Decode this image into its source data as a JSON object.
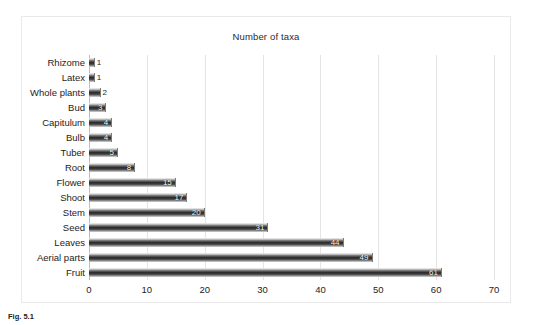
{
  "figure": {
    "caption_label": "Fig. 5.1",
    "caption_text": ""
  },
  "chart": {
    "title": "Number of taxa",
    "frame_border_color": "#e9e9e9",
    "gridline_color": "#e4e4e4",
    "bar_dark_color": "#2e2e2e",
    "bar_light_color": "#f2f2f2",
    "label_color": "#1d1d1d"
  },
  "chart_data": {
    "type": "bar",
    "orientation": "horizontal",
    "title": "Number of taxa",
    "xlabel": "",
    "ylabel": "",
    "xlim": [
      0,
      70
    ],
    "xticks": [
      0,
      10,
      20,
      30,
      40,
      50,
      60,
      70
    ],
    "grid": true,
    "legend": false,
    "data_labels": true,
    "categories": [
      "Rhizome",
      "Latex",
      "Whole plants",
      "Bud",
      "Capitulum",
      "Bulb",
      "Tuber",
      "Root",
      "Flower",
      "Shoot",
      "Stem",
      "Seed",
      "Leaves",
      "Aerial parts",
      "Fruit"
    ],
    "values": [
      1,
      1,
      2,
      3,
      4,
      4,
      5,
      8,
      15,
      17,
      20,
      31,
      44,
      49,
      61
    ]
  }
}
